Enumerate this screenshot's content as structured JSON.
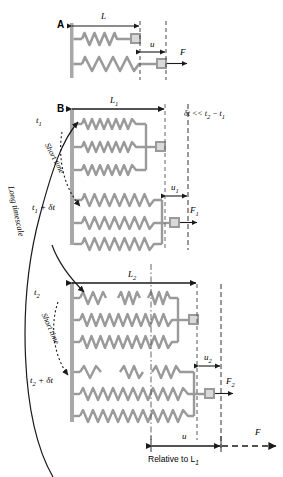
{
  "figure": {
    "colors": {
      "spring": "#9a9a9a",
      "wall": "#a8a8a8",
      "line": "#1a1a1a",
      "dashed": "#333333",
      "node_fill": "#d9d9d9",
      "background": "#ffffff"
    }
  },
  "panels": [
    {
      "id": "A",
      "label": "A",
      "dimension_label": "L",
      "displacement_label": "u",
      "force_label": "F",
      "springs": 1,
      "rows": 2
    },
    {
      "id": "B",
      "label": "B",
      "note": "δt << t₂ − t₁",
      "groups": [
        {
          "time_label_top": "t₁",
          "time_label_bottom": "t₁ + δt",
          "dimension_label": "L₁",
          "displacement_label": "u₁",
          "force_label": "F₁",
          "springs_per_row": 3,
          "short_time_label": "Short time"
        },
        {
          "time_label_top": "t₂",
          "time_label_bottom": "t₂ + δt",
          "dimension_label": "L₂",
          "displacement_label": "u₂",
          "force_label": "F₂",
          "springs_per_row": 3,
          "short_time_label": "Short time"
        }
      ],
      "long_timescale_label": "Long timescale",
      "bottom_displacement_label": "u",
      "bottom_force_label": "F",
      "bottom_reference_label": "Relative to L₁"
    }
  ],
  "labels": {
    "panel_a": "A",
    "panel_b": "B",
    "L": "L",
    "u": "u",
    "F": "F",
    "L1": "L",
    "L1_sub": "1",
    "u1": "u",
    "u1_sub": "1",
    "F1": "F",
    "F1_sub": "1",
    "L2": "L",
    "L2_sub": "2",
    "u2": "u",
    "u2_sub": "2",
    "F2": "F",
    "F2_sub": "2",
    "t1": "t",
    "t1_sub": "1",
    "t1_dt": "t",
    "t1_dt_sub": "1",
    "t1_dt_rest": " + δt",
    "t2": "t",
    "t2_sub": "2",
    "t2_dt": "t",
    "t2_dt_sub": "2",
    "t2_dt_rest": " + δt",
    "delta_note": "δt << t",
    "delta_note_sub1": "2",
    "delta_note_mid": " − t",
    "delta_note_sub2": "1",
    "short_time_1": "Short time",
    "short_time_2": "Short time",
    "long_timescale": "Long timescale",
    "relative_to": "Relative to L",
    "relative_to_sub": "1",
    "bottom_u": "u",
    "bottom_F": "F"
  }
}
